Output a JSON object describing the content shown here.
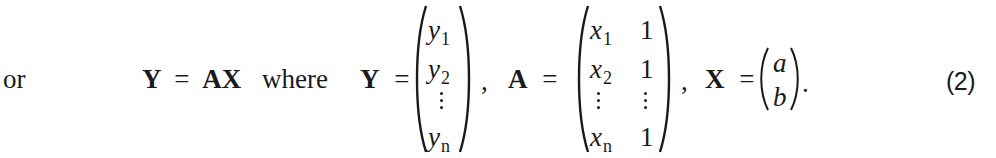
{
  "equation": {
    "lead_word": "or",
    "main": {
      "lhs": "Y",
      "eq": "=",
      "rhs": "AX"
    },
    "where_word": "where",
    "Y_def": {
      "name": "Y",
      "eq": "=",
      "entries": [
        {
          "base": "y",
          "sub": "1"
        },
        {
          "base": "y",
          "sub": "2"
        },
        {
          "base": "⋮",
          "sub": ""
        },
        {
          "base": "y",
          "sub": "n"
        }
      ],
      "trailing": ","
    },
    "A_def": {
      "name": "A",
      "eq": "=",
      "rows": [
        [
          {
            "base": "x",
            "sub": "1"
          },
          {
            "base": "1",
            "sub": ""
          }
        ],
        [
          {
            "base": "x",
            "sub": "2"
          },
          {
            "base": "1",
            "sub": ""
          }
        ],
        [
          {
            "base": "⋮",
            "sub": ""
          },
          {
            "base": "⋮",
            "sub": ""
          }
        ],
        [
          {
            "base": "x",
            "sub": "n"
          },
          {
            "base": "1",
            "sub": ""
          }
        ]
      ],
      "trailing": ","
    },
    "X_def": {
      "name": "X",
      "eq": "=",
      "entries": [
        {
          "base": "a"
        },
        {
          "base": "b"
        }
      ],
      "trailing": "."
    },
    "number": "(2)"
  }
}
